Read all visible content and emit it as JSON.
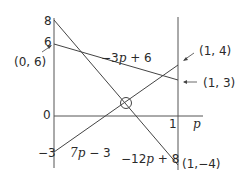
{
  "diagram": {
    "title": "",
    "axis": {
      "x_label": "p",
      "y_ticks": [
        "8",
        "6",
        "0",
        "−3"
      ],
      "x_ticks": [
        "1"
      ]
    },
    "lines": [
      {
        "name": "line-a",
        "label": "−3p + 6",
        "from": [
          0,
          6
        ],
        "to": [
          1,
          3
        ]
      },
      {
        "name": "line-b",
        "label": "7p − 3",
        "from": [
          0,
          -3
        ],
        "to": [
          1,
          4
        ]
      },
      {
        "name": "line-c",
        "label": "−12p + 8",
        "from": [
          0,
          8
        ],
        "to": [
          1,
          -4
        ]
      }
    ],
    "points": {
      "p06": "(0, 6)",
      "p14": "(1, 4)",
      "p13": "(1, 3)",
      "p1m4": "(1,−4)"
    },
    "labels": {
      "line_a_text": "−3",
      "line_a_var": "p",
      "line_a_rest": " + 6",
      "line_b_num": "7",
      "line_b_var": "p",
      "line_b_rest": " − 3",
      "line_c_num": "−12",
      "line_c_var": "p",
      "line_c_rest": " + 8"
    },
    "colors": {
      "ink": "#2a2a2a",
      "background": "#ffffff"
    }
  }
}
